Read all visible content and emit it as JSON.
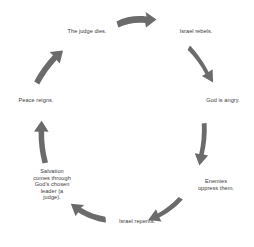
{
  "diagram": {
    "type": "cycle",
    "title": "",
    "direction": "clockwise",
    "arrow_color": "#6b6b6b",
    "text_color": "#3b3b3b",
    "background_color": "#ffffff",
    "nodes": [
      {
        "id": "judge-dies",
        "label": "The judge dies.",
        "position": "top-left"
      },
      {
        "id": "israel-rebels",
        "label": "Israel rebels.",
        "position": "top-right"
      },
      {
        "id": "god-angry",
        "label": "God is angry.",
        "position": "right"
      },
      {
        "id": "enemies",
        "label": "Enemies\noppress them.",
        "position": "bottom-right"
      },
      {
        "id": "israel-repents",
        "label": "Israel repents.",
        "position": "bottom"
      },
      {
        "id": "salvation",
        "label": "Salvation\ncomes through\nGod's chosen\nleader (a\njudge).",
        "position": "bottom-left"
      },
      {
        "id": "peace-reigns",
        "label": "Peace reigns.",
        "position": "left"
      }
    ],
    "arrows": [
      {
        "id": "arrow-judge-to-rebels",
        "from": "judge-dies",
        "to": "israel-rebels",
        "points": "right"
      },
      {
        "id": "arrow-rebels-to-angry",
        "from": "israel-rebels",
        "to": "god-angry",
        "points": "down-right"
      },
      {
        "id": "arrow-angry-to-enemies",
        "from": "god-angry",
        "to": "enemies",
        "points": "down"
      },
      {
        "id": "arrow-enemies-to-repents",
        "from": "enemies",
        "to": "israel-repents",
        "points": "left"
      },
      {
        "id": "arrow-repents-to-salvation",
        "from": "israel-repents",
        "to": "salvation",
        "points": "up-left"
      },
      {
        "id": "arrow-salvation-to-peace",
        "from": "salvation",
        "to": "peace-reigns",
        "points": "up"
      },
      {
        "id": "arrow-peace-to-judge",
        "from": "peace-reigns",
        "to": "judge-dies",
        "points": "up-right"
      }
    ]
  }
}
